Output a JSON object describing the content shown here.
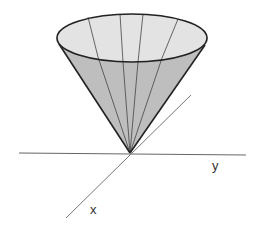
{
  "figure": {
    "type": "3D cone with vertex at origin",
    "axes": {
      "x_label": "x",
      "y_label": "y"
    },
    "colors": {
      "cone_outer": "#bdbdbd",
      "cone_inner": "#e2e2e2",
      "outline": "#222222",
      "axis": "#555555"
    }
  }
}
